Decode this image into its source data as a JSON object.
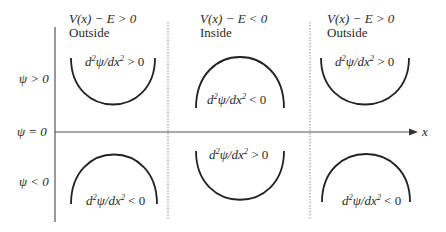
{
  "diagram": {
    "title": "",
    "regions": [
      {
        "condition": "V(x) − E > 0",
        "name": "Outside"
      },
      {
        "condition": "V(x) − E < 0",
        "name": "Inside"
      },
      {
        "condition": "V(x) − E > 0",
        "name": "Outside"
      }
    ],
    "rows": [
      {
        "label": "ψ > 0"
      },
      {
        "label": "ψ = 0"
      },
      {
        "label": "ψ < 0"
      }
    ],
    "axis_label": "x",
    "curves": [
      {
        "region": 0,
        "row": "psi_positive",
        "shape": "concave-up",
        "label": "d²ψ/dx² > 0"
      },
      {
        "region": 1,
        "row": "psi_positive",
        "shape": "concave-down",
        "label": "d²ψ/dx² < 0"
      },
      {
        "region": 2,
        "row": "psi_positive",
        "shape": "concave-up",
        "label": "d²ψ/dx² > 0"
      },
      {
        "region": 0,
        "row": "psi_negative",
        "shape": "concave-down",
        "label": "d²ψ/dx² < 0"
      },
      {
        "region": 1,
        "row": "psi_negative",
        "shape": "concave-up",
        "label": "d²ψ/dx² > 0"
      },
      {
        "region": 2,
        "row": "psi_negative",
        "shape": "concave-down",
        "label": "d²ψ/dx² < 0"
      }
    ],
    "eq_parts": {
      "d": "d",
      "two": "2",
      "psi": "ψ",
      "slash_dx": "/dx",
      "gt0": " > 0",
      "lt0": " < 0"
    },
    "colors": {
      "ink": "#2a2a2a",
      "divider": "#8a8a8a",
      "axis": "#555555"
    }
  }
}
